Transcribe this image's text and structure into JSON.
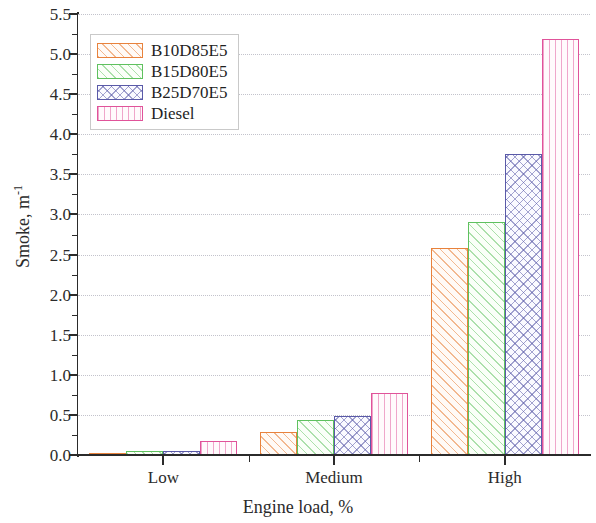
{
  "chart_data": {
    "type": "bar",
    "title": "",
    "xlabel": "Engine load, %",
    "ylabel": "Smoke, m",
    "ylabel_exponent": "-1",
    "categories": [
      "Low",
      "Medium",
      "High"
    ],
    "series": [
      {
        "name": "B10D85E5",
        "color": "#e8823c",
        "pattern": "diagonal-hatch",
        "values": [
          0.02,
          0.29,
          2.58
        ]
      },
      {
        "name": "B15D80E5",
        "color": "#5fc15f",
        "pattern": "diagonal-hatch",
        "values": [
          0.05,
          0.44,
          2.91
        ]
      },
      {
        "name": "B25D70E5",
        "color": "#5a5aa8",
        "pattern": "cross-hatch",
        "values": [
          0.05,
          0.49,
          3.76
        ]
      },
      {
        "name": "Diesel",
        "color": "#e0539a",
        "pattern": "vertical-hatch",
        "values": [
          0.18,
          0.77,
          5.19
        ]
      }
    ],
    "ylim": [
      0.0,
      5.5
    ],
    "yticks": [
      0.0,
      0.5,
      1.0,
      1.5,
      2.0,
      2.5,
      3.0,
      3.5,
      4.0,
      4.5,
      5.0,
      5.5
    ],
    "ytick_labels": [
      "0.0",
      "0.5",
      "1.0",
      "1.5",
      "2.0",
      "2.5",
      "3.0",
      "3.5",
      "4.0",
      "4.5",
      "5.0",
      "5.5"
    ],
    "yminor_ticks": [
      0.25,
      0.75,
      1.25,
      1.75,
      2.25,
      2.75,
      3.25,
      3.75,
      4.25,
      4.75,
      5.25
    ],
    "grid": true,
    "grid_style": "dotted",
    "grid_color": "#b9b9c4",
    "legend_position": "upper-left",
    "axis_color": "#2b2b2b"
  }
}
